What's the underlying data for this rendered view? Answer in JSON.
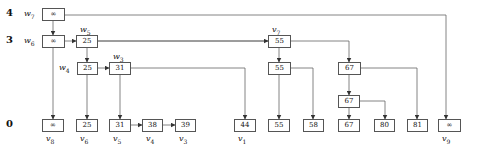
{
  "levels": [
    {
      "label": "4",
      "y": 8
    },
    {
      "label": "3",
      "y": 35
    },
    {
      "label": "0",
      "y": 119
    }
  ],
  "nodes": [
    {
      "id": "w7",
      "value": "∞",
      "x": 42,
      "y": 8,
      "w": 23,
      "label": "w",
      "sub": "7",
      "label_pos": "left"
    },
    {
      "id": "w6",
      "value": "∞",
      "x": 42,
      "y": 35,
      "w": 23,
      "label": "w",
      "sub": "6",
      "label_pos": "left"
    },
    {
      "id": "w5",
      "value": "25",
      "x": 76,
      "y": 35,
      "w": 22,
      "label": "w",
      "sub": "5",
      "label_pos": "top"
    },
    {
      "id": "w4",
      "value": "25",
      "x": 77,
      "y": 62,
      "w": 21,
      "label": "w",
      "sub": "4",
      "label_pos": "left"
    },
    {
      "id": "w3",
      "value": "31",
      "x": 109,
      "y": 62,
      "w": 22,
      "label": "w",
      "sub": "3",
      "label_pos": "top"
    },
    {
      "id": "v7",
      "value": "55",
      "x": 268,
      "y": 35,
      "w": 23,
      "label": "v",
      "sub": "7",
      "label_pos": "top"
    },
    {
      "id": "n55b",
      "value": "55",
      "x": 268,
      "y": 62,
      "w": 23
    },
    {
      "id": "n67a",
      "value": "67",
      "x": 338,
      "y": 62,
      "w": 23
    },
    {
      "id": "n67b",
      "value": "67",
      "x": 338,
      "y": 95,
      "w": 22
    },
    {
      "id": "v8",
      "value": "∞",
      "x": 42,
      "y": 119,
      "w": 22,
      "label": "v",
      "sub": "8",
      "label_pos": "bottom"
    },
    {
      "id": "v6",
      "value": "25",
      "x": 76,
      "y": 119,
      "w": 22,
      "label": "v",
      "sub": "6",
      "label_pos": "bottom"
    },
    {
      "id": "v5",
      "value": "31",
      "x": 109,
      "y": 119,
      "w": 22,
      "label": "v",
      "sub": "5",
      "label_pos": "bottom"
    },
    {
      "id": "v4",
      "value": "38",
      "x": 142,
      "y": 119,
      "w": 21,
      "label": "v",
      "sub": "4",
      "label_pos": "bottom"
    },
    {
      "id": "v3",
      "value": "39",
      "x": 175,
      "y": 119,
      "w": 21,
      "label": "v",
      "sub": "3",
      "label_pos": "bottom"
    },
    {
      "id": "v1",
      "value": "44",
      "x": 234,
      "y": 119,
      "w": 22,
      "label": "v",
      "sub": "1",
      "label_pos": "bottom"
    },
    {
      "id": "b55",
      "value": "55",
      "x": 268,
      "y": 119,
      "w": 22
    },
    {
      "id": "b58",
      "value": "58",
      "x": 303,
      "y": 119,
      "w": 21
    },
    {
      "id": "b67",
      "value": "67",
      "x": 338,
      "y": 119,
      "w": 22
    },
    {
      "id": "b80",
      "value": "80",
      "x": 374,
      "y": 119,
      "w": 21
    },
    {
      "id": "b81",
      "value": "81",
      "x": 407,
      "y": 119,
      "w": 21
    },
    {
      "id": "v9",
      "value": "∞",
      "x": 438,
      "y": 119,
      "w": 23,
      "label": "v",
      "sub": "9",
      "label_pos": "bottom"
    }
  ],
  "edges": [
    {
      "path": "65,15 446,15 446,119",
      "arrow": true
    },
    {
      "path": "53,21 53,35",
      "arrow": true
    },
    {
      "path": "65,41 76,41",
      "arrow": true
    },
    {
      "path": "53,48 53,119",
      "arrow": true
    },
    {
      "path": "98,41 279,41",
      "arrow": false
    },
    {
      "path": "98,41 268,41",
      "arrow": true
    },
    {
      "path": "87,48 87,62",
      "arrow": true
    },
    {
      "path": "98,68 109,68",
      "arrow": true
    },
    {
      "path": "87,75 87,119",
      "arrow": true
    },
    {
      "path": "131,68 245,68 245,119",
      "arrow": true
    },
    {
      "path": "120,75 120,119",
      "arrow": true
    },
    {
      "path": "163,125 175,125",
      "arrow": true
    },
    {
      "path": "131,125 142,125",
      "arrow": true
    },
    {
      "path": "291,41 349,41 349,62",
      "arrow": true
    },
    {
      "path": "279,48 279,62",
      "arrow": true
    },
    {
      "path": "279,75 279,119",
      "arrow": true
    },
    {
      "path": "291,68 313,68 313,119",
      "arrow": true
    },
    {
      "path": "349,75 349,95",
      "arrow": true
    },
    {
      "path": "361,68 417,68 417,119",
      "arrow": true
    },
    {
      "path": "349,108 349,119",
      "arrow": true
    },
    {
      "path": "360,101 385,101 385,119",
      "arrow": true
    }
  ]
}
